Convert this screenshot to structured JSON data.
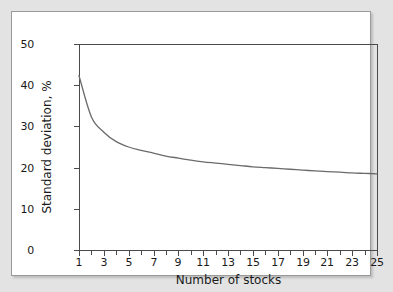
{
  "figure": {
    "background_color": "#e3e3e3",
    "panel_color": "#ffffff",
    "panel_border_color": "#9a9a9a"
  },
  "chart_data": {
    "type": "line",
    "title": "",
    "xlabel": "Number of stocks",
    "ylabel": "Standard deviation, %",
    "xlim": [
      1,
      25
    ],
    "ylim": [
      0,
      50
    ],
    "grid": false,
    "legend": null,
    "line_color": "#6b6b6b",
    "axis_color": "#4a4a4a",
    "x_tick_labels": [
      "1",
      "3",
      "5",
      "7",
      "9",
      "11",
      "13",
      "15",
      "17",
      "19",
      "21",
      "23",
      "25"
    ],
    "x_tick_values": [
      1,
      3,
      5,
      7,
      9,
      11,
      13,
      15,
      17,
      19,
      21,
      23,
      25
    ],
    "x_minor_ticks": [
      2,
      4,
      6,
      8,
      10,
      12,
      14,
      16,
      18,
      20,
      22,
      24
    ],
    "y_tick_labels": [
      "0",
      "10",
      "20",
      "30",
      "40",
      "50"
    ],
    "y_tick_values": [
      0,
      10,
      20,
      30,
      40,
      50
    ],
    "x": [
      1,
      2,
      3,
      4,
      5,
      6,
      7,
      8,
      9,
      10,
      11,
      12,
      13,
      14,
      15,
      16,
      17,
      18,
      19,
      20,
      21,
      22,
      23,
      24,
      25
    ],
    "values": [
      42.3,
      32.3,
      28.6,
      26.3,
      25.0,
      24.2,
      23.5,
      22.8,
      22.3,
      21.8,
      21.4,
      21.1,
      20.8,
      20.5,
      20.2,
      20.0,
      19.8,
      19.6,
      19.4,
      19.2,
      19.0,
      18.9,
      18.7,
      18.6,
      18.5
    ]
  }
}
